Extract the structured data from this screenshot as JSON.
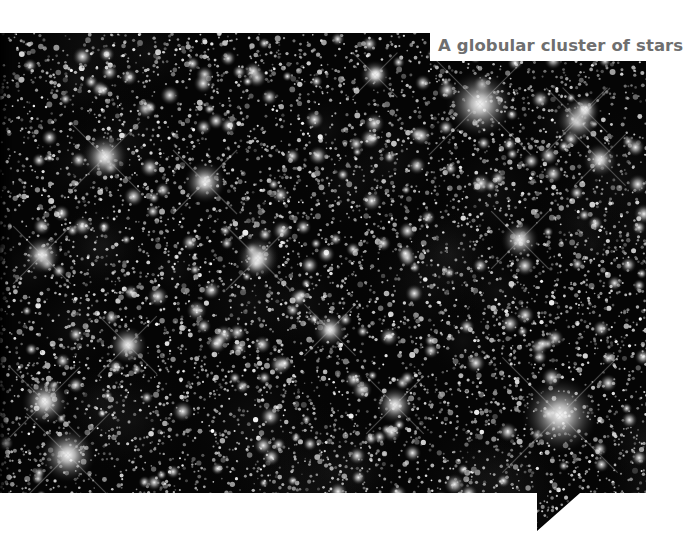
{
  "caption": {
    "text": "A globular cluster of stars"
  },
  "image": {
    "subject": "globular star cluster",
    "shape": "speech-bubble",
    "background_color": "#000000",
    "frame_color": "#ffffff",
    "caption_color": "#6f6f6f",
    "bright_stars": [
      {
        "x": 480,
        "y": 104,
        "r": 16
      },
      {
        "x": 560,
        "y": 415,
        "r": 18
      },
      {
        "x": 105,
        "y": 157,
        "r": 11
      },
      {
        "x": 205,
        "y": 182,
        "r": 10
      },
      {
        "x": 258,
        "y": 258,
        "r": 10
      },
      {
        "x": 42,
        "y": 255,
        "r": 9
      },
      {
        "x": 45,
        "y": 402,
        "r": 11
      },
      {
        "x": 68,
        "y": 455,
        "r": 13
      },
      {
        "x": 128,
        "y": 345,
        "r": 9
      },
      {
        "x": 395,
        "y": 405,
        "r": 9
      },
      {
        "x": 578,
        "y": 120,
        "r": 10
      },
      {
        "x": 600,
        "y": 160,
        "r": 8
      },
      {
        "x": 520,
        "y": 240,
        "r": 9
      },
      {
        "x": 330,
        "y": 330,
        "r": 8
      },
      {
        "x": 585,
        "y": 110,
        "r": 7
      },
      {
        "x": 375,
        "y": 75,
        "r": 7
      }
    ]
  }
}
